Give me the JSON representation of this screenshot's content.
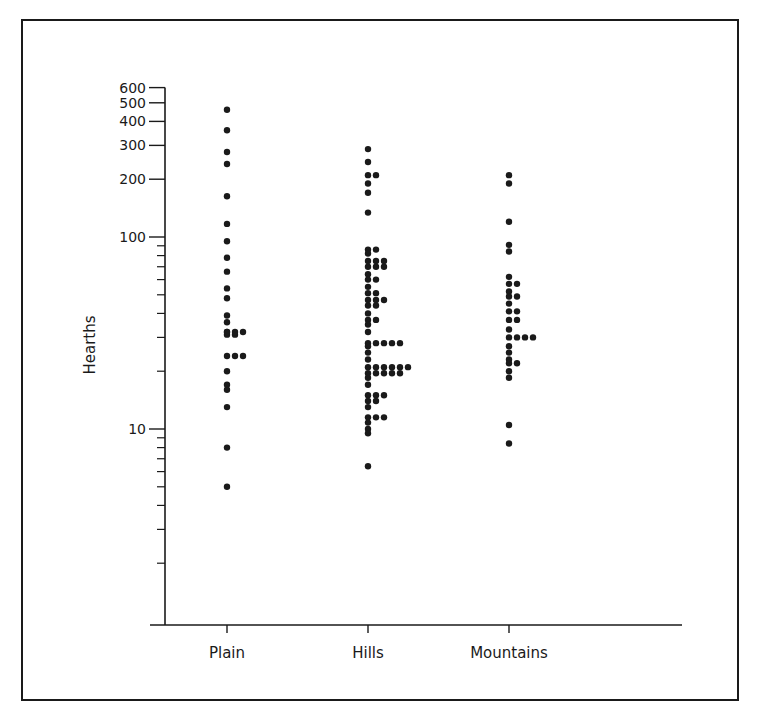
{
  "chart_data": {
    "type": "scatter",
    "subtype": "dot-plot",
    "title": "",
    "xlabel": "",
    "ylabel": "Hearths",
    "yscale": "log",
    "ylim": [
      1,
      600
    ],
    "categories": [
      "Plain",
      "Hills",
      "Mountains"
    ],
    "y_major_ticks": [
      10,
      100,
      200,
      300,
      400,
      500,
      600
    ],
    "y_tick_labels": [
      "10",
      "100",
      "200",
      "300",
      "400",
      "500",
      "600"
    ],
    "grid": false,
    "legend": null,
    "series": [
      {
        "name": "Plain",
        "points": [
          [
            460,
            1
          ],
          [
            360,
            1
          ],
          [
            277,
            1
          ],
          [
            240,
            1
          ],
          [
            163,
            1
          ],
          [
            117,
            1
          ],
          [
            95,
            1
          ],
          [
            78,
            1
          ],
          [
            66,
            1
          ],
          [
            54,
            1
          ],
          [
            48,
            1
          ],
          [
            39,
            1
          ],
          [
            36,
            1
          ],
          [
            32,
            1
          ],
          [
            31,
            2
          ],
          [
            32,
            3
          ],
          [
            24,
            3
          ],
          [
            20,
            1
          ],
          [
            17,
            1
          ],
          [
            16,
            1
          ],
          [
            13,
            1
          ],
          [
            8,
            1
          ],
          [
            5,
            1
          ]
        ]
      },
      {
        "name": "Hills",
        "points": [
          [
            287,
            1
          ],
          [
            246,
            1
          ],
          [
            210,
            2
          ],
          [
            190,
            1
          ],
          [
            170,
            1
          ],
          [
            134,
            1
          ],
          [
            86,
            2
          ],
          [
            82,
            1
          ],
          [
            75,
            3
          ],
          [
            70,
            3
          ],
          [
            64,
            1
          ],
          [
            60,
            2
          ],
          [
            55,
            1
          ],
          [
            51,
            2
          ],
          [
            47,
            3
          ],
          [
            44,
            2
          ],
          [
            40,
            1
          ],
          [
            37,
            2
          ],
          [
            35,
            1
          ],
          [
            32,
            1
          ],
          [
            28,
            5
          ],
          [
            27,
            1
          ],
          [
            25,
            1
          ],
          [
            23,
            1
          ],
          [
            21,
            6
          ],
          [
            19.5,
            5
          ],
          [
            18.5,
            1
          ],
          [
            17,
            1
          ],
          [
            15,
            3
          ],
          [
            14,
            2
          ],
          [
            13,
            1
          ],
          [
            11.5,
            3
          ],
          [
            10.8,
            1
          ],
          [
            10,
            1
          ],
          [
            9.5,
            1
          ],
          [
            6.4,
            1
          ]
        ]
      },
      {
        "name": "Mountains",
        "points": [
          [
            210,
            1
          ],
          [
            190,
            1
          ],
          [
            120,
            1
          ],
          [
            91,
            1
          ],
          [
            84,
            1
          ],
          [
            62,
            1
          ],
          [
            57,
            2
          ],
          [
            52,
            1
          ],
          [
            49,
            2
          ],
          [
            45,
            1
          ],
          [
            41,
            2
          ],
          [
            37,
            2
          ],
          [
            33,
            1
          ],
          [
            30,
            4
          ],
          [
            27,
            1
          ],
          [
            25,
            1
          ],
          [
            23,
            1
          ],
          [
            22,
            2
          ],
          [
            20,
            1
          ],
          [
            18.5,
            1
          ],
          [
            10.5,
            1
          ],
          [
            8.4,
            1
          ]
        ]
      }
    ],
    "point_format": "[value, count_of_dots_in_row]"
  },
  "colors": {
    "ink": "#1a1a1a",
    "background": "#ffffff"
  }
}
